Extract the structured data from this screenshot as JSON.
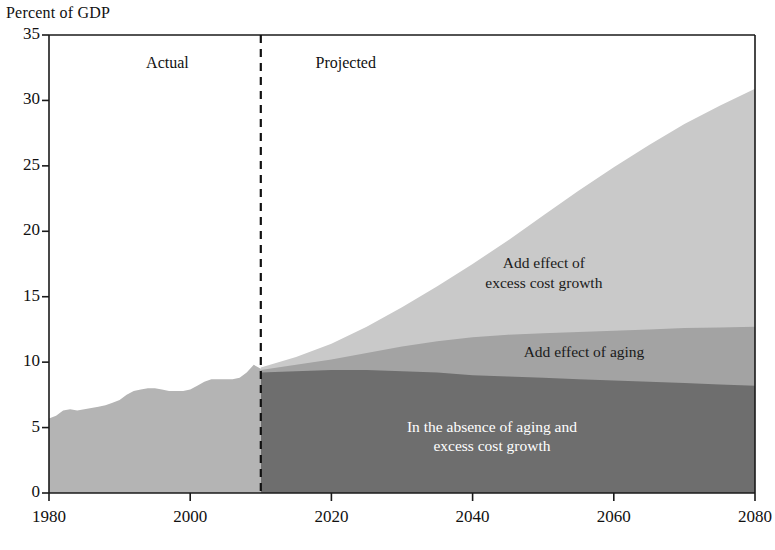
{
  "chart_data": {
    "type": "area",
    "title": "Percent of GDP",
    "xlabel": "",
    "ylabel": "Percent of GDP",
    "xlim": [
      1980,
      2080
    ],
    "ylim": [
      0,
      35
    ],
    "ytick_labels": [
      "0",
      "5",
      "10",
      "15",
      "20",
      "25",
      "30",
      "35"
    ],
    "ytick_values": [
      0,
      5,
      10,
      15,
      20,
      25,
      30,
      35
    ],
    "xtick_labels": [
      "1980",
      "2000",
      "2020",
      "2040",
      "2060",
      "2080"
    ],
    "xtick_values": [
      1980,
      2000,
      2020,
      2040,
      2060,
      2080
    ],
    "grid": false,
    "legend": "none",
    "stacked": true,
    "divider_year": 2010,
    "divider_style": "dashed",
    "period_labels": [
      {
        "text": "Actual",
        "year": 1998
      },
      {
        "text": "Projected",
        "year": 2022
      }
    ],
    "annotations": [
      {
        "text_lines": [
          "Add effect of",
          "excess cost growth"
        ],
        "year": 2052,
        "value": 16.8,
        "color": "#1a1a1a"
      },
      {
        "text_lines": [
          "Add effect of aging"
        ],
        "year": 2058,
        "value": 10.8,
        "color": "#1a1a1a"
      },
      {
        "text_lines": [
          "In the absence of aging and",
          "excess cost growth"
        ],
        "year": 2046,
        "value": 4.3,
        "color": "#ffffff"
      }
    ],
    "colors": {
      "baseline": "#6e6e6e",
      "aging": "#a3a3a3",
      "excess_cost_growth": "#c9c9c9",
      "historical": "#b4b4b4",
      "axis": "#1a1a1a",
      "divider": "#111111"
    },
    "series": [
      {
        "name": "Historical (total)",
        "key": "historical",
        "period": "actual",
        "x": [
          1980,
          1981,
          1982,
          1983,
          1984,
          1985,
          1986,
          1987,
          1988,
          1989,
          1990,
          1991,
          1992,
          1993,
          1994,
          1995,
          1996,
          1997,
          1998,
          1999,
          2000,
          2001,
          2002,
          2003,
          2004,
          2005,
          2006,
          2007,
          2008,
          2009,
          2010
        ],
        "values": [
          5.7,
          5.9,
          6.3,
          6.4,
          6.3,
          6.4,
          6.5,
          6.6,
          6.7,
          6.9,
          7.1,
          7.5,
          7.8,
          7.9,
          8.0,
          8.0,
          7.9,
          7.8,
          7.8,
          7.8,
          7.9,
          8.2,
          8.5,
          8.7,
          8.7,
          8.7,
          8.7,
          8.8,
          9.2,
          9.8,
          9.5
        ]
      },
      {
        "name": "In the absence of aging and excess cost growth",
        "key": "baseline",
        "period": "projected",
        "x": [
          2010,
          2015,
          2020,
          2025,
          2030,
          2035,
          2040,
          2045,
          2050,
          2055,
          2060,
          2065,
          2070,
          2075,
          2080
        ],
        "values": [
          9.2,
          9.3,
          9.4,
          9.4,
          9.3,
          9.2,
          9.0,
          8.9,
          8.8,
          8.7,
          8.6,
          8.5,
          8.4,
          8.3,
          8.2
        ]
      },
      {
        "name": "Add effect of aging",
        "key": "aging",
        "period": "projected",
        "x": [
          2010,
          2015,
          2020,
          2025,
          2030,
          2035,
          2040,
          2045,
          2050,
          2055,
          2060,
          2065,
          2070,
          2075,
          2080
        ],
        "values": [
          9.4,
          9.8,
          10.2,
          10.7,
          11.2,
          11.6,
          11.9,
          12.1,
          12.2,
          12.3,
          12.4,
          12.5,
          12.6,
          12.65,
          12.7
        ]
      },
      {
        "name": "Add effect of excess cost growth",
        "key": "excess_cost_growth",
        "period": "projected",
        "x": [
          2010,
          2015,
          2020,
          2025,
          2030,
          2035,
          2040,
          2045,
          2050,
          2055,
          2060,
          2065,
          2070,
          2075,
          2080
        ],
        "values": [
          9.6,
          10.4,
          11.4,
          12.7,
          14.2,
          15.8,
          17.5,
          19.3,
          21.2,
          23.1,
          24.9,
          26.6,
          28.2,
          29.6,
          30.9
        ]
      }
    ]
  }
}
